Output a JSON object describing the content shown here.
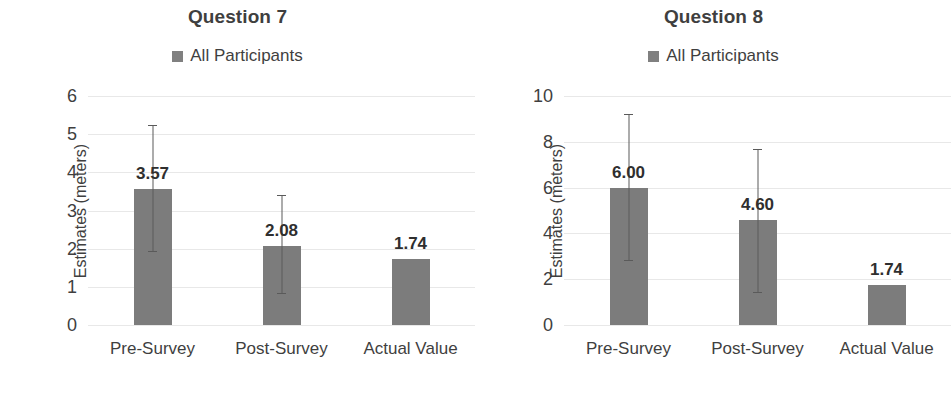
{
  "chart_data": [
    {
      "type": "bar",
      "title": "Question 7",
      "xlabel": "",
      "ylabel": "Estimates (meters)",
      "categories": [
        "Pre-Survey",
        "Post-Survey",
        "Actual Value"
      ],
      "values": [
        3.57,
        2.08,
        1.74
      ],
      "data_labels": [
        "3.57",
        "2.08",
        "1.74"
      ],
      "error_bars": [
        {
          "upper": 5.25,
          "lower": 1.9
        },
        {
          "upper": 3.4,
          "lower": 0.8
        },
        null
      ],
      "ylim": [
        0,
        6
      ],
      "yticks": [
        6,
        5,
        4,
        3,
        2,
        1,
        0
      ],
      "ytick_labels": [
        "6",
        "5",
        "4",
        "3",
        "2",
        "1",
        "0"
      ],
      "grid": true,
      "legend": {
        "position": "top",
        "entries": [
          "All Participants"
        ]
      },
      "series_color": "#7c7c7c"
    },
    {
      "type": "bar",
      "title": "Question 8",
      "xlabel": "",
      "ylabel": "Estimates (meters)",
      "categories": [
        "Pre-Survey",
        "Post-Survey",
        "Actual Value"
      ],
      "values": [
        6.0,
        4.6,
        1.74
      ],
      "data_labels": [
        "6.00",
        "4.60",
        "1.74"
      ],
      "error_bars": [
        {
          "upper": 9.2,
          "lower": 2.8
        },
        {
          "upper": 7.7,
          "lower": 1.4
        },
        null
      ],
      "ylim": [
        0,
        10
      ],
      "yticks": [
        10,
        8,
        6,
        4,
        2,
        0
      ],
      "ytick_labels": [
        "10",
        "8",
        "6",
        "4",
        "2",
        "0"
      ],
      "grid": true,
      "legend": {
        "position": "top",
        "entries": [
          "All Participants"
        ]
      },
      "series_color": "#7c7c7c"
    }
  ],
  "colors": {
    "bar": "#7c7c7c",
    "legend_swatch": "#808080",
    "grid": "#e8e8e8",
    "text": "#3f3f3f",
    "error": "#5a5a5a",
    "background": "#ffffff"
  },
  "icons": {
    "legend_marker": "legend-square-icon"
  }
}
